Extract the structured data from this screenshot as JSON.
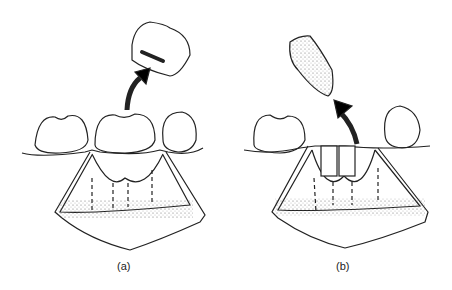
{
  "panels": [
    {
      "id": "a",
      "label": "(a)"
    },
    {
      "id": "b",
      "label": "(b)"
    }
  ]
}
